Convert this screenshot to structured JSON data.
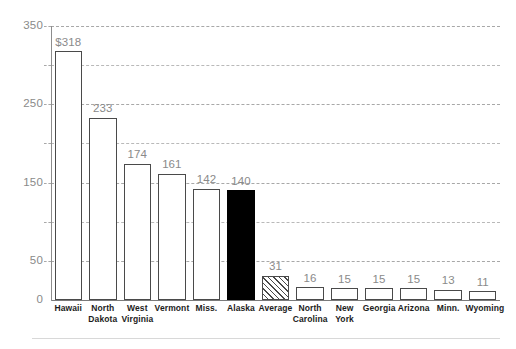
{
  "chart_data": {
    "type": "bar",
    "title": "",
    "subtitle": "",
    "xlabel": "",
    "ylabel": "",
    "ylim": [
      0,
      350
    ],
    "grid": true,
    "legend_position": "none",
    "y_ticks": [
      0,
      50,
      150,
      250,
      350
    ],
    "y_tick_labels": [
      "0",
      "50",
      "150",
      "250",
      "350"
    ],
    "y_gridlines": [
      0,
      50,
      100,
      150,
      200,
      250,
      300,
      350
    ],
    "categories": [
      "Hawaii",
      "North Dakota",
      "West Virginia",
      "Vermont",
      "Miss.",
      "Alaska",
      "Average",
      "North Carolina",
      "New York",
      "Georgia",
      "Arizona",
      "Minn.",
      "Wyoming"
    ],
    "category_lines": [
      [
        "Hawaii"
      ],
      [
        "North",
        "Dakota"
      ],
      [
        "West",
        "Virginia"
      ],
      [
        "Vermont"
      ],
      [
        "Miss."
      ],
      [
        "Alaska"
      ],
      [
        "Average"
      ],
      [
        "North",
        "Carolina"
      ],
      [
        "New",
        "York"
      ],
      [
        "Georgia"
      ],
      [
        "Arizona"
      ],
      [
        "Minn."
      ],
      [
        "Wyoming"
      ]
    ],
    "values": [
      318,
      233,
      174,
      161,
      142,
      140,
      31,
      16,
      15,
      15,
      15,
      13,
      11
    ],
    "data_labels": [
      "$318",
      "233",
      "174",
      "161",
      "142",
      "140",
      "31",
      "16",
      "15",
      "15",
      "15",
      "13",
      "11"
    ],
    "bar_styles": [
      "outline",
      "outline",
      "outline",
      "outline",
      "outline",
      "solid",
      "hatched",
      "outline",
      "outline",
      "outline",
      "outline",
      "outline",
      "outline"
    ]
  },
  "colors": {
    "bar_outline": "#4a4a4a",
    "bar_fill": "#ffffff",
    "bar_highlight": "#000000",
    "gridline": "#b9b9b9",
    "value_label": "#8a8a8a",
    "axis_label": "#8a8a8a",
    "category_label": "#1c1c1c",
    "rule": "#d8d8d8"
  }
}
